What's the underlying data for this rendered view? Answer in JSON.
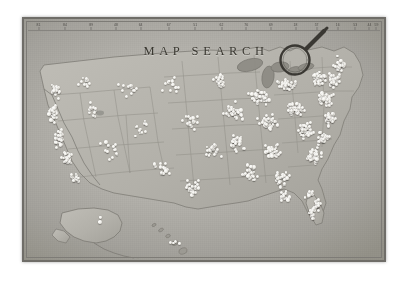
{
  "photo": {
    "alt_description": "Black and white photograph of a framed vintage United States wall map covered with white map pins",
    "background_color": "#ffffff"
  },
  "map": {
    "title": "MAP SEARCH",
    "frame_color": "#6f6d68",
    "paper_color": "#b5b3ad",
    "pin_color": "#f2f1ec",
    "land_color": "#b0aea7",
    "water_color": "#9b9992"
  },
  "magnifier": {
    "icon": "magnifying-glass-icon",
    "stroke_color": "#3a3833"
  },
  "ruler": {
    "label": "longitude-scale",
    "ticks": [
      {
        "value": "81",
        "x": 3
      },
      {
        "value": "84",
        "x": 10.5
      },
      {
        "value": "89",
        "x": 18
      },
      {
        "value": "48",
        "x": 25
      },
      {
        "value": "64",
        "x": 32
      },
      {
        "value": "67",
        "x": 40
      },
      {
        "value": "51",
        "x": 47.5
      },
      {
        "value": "62",
        "x": 55
      },
      {
        "value": "76",
        "x": 62
      },
      {
        "value": "69",
        "x": 69
      },
      {
        "value": "18",
        "x": 76
      },
      {
        "value": "57",
        "x": 82
      },
      {
        "value": "16",
        "x": 88
      },
      {
        "value": "53",
        "x": 93
      },
      {
        "value": "44",
        "x": 97
      },
      {
        "value": "59",
        "x": 99
      }
    ]
  },
  "regions": [
    {
      "name": "california-coast-cluster",
      "density": "high"
    },
    {
      "name": "pacific-northwest-cluster",
      "density": "medium"
    },
    {
      "name": "interior-west-sparse",
      "density": "low"
    },
    {
      "name": "texas-gulf-cluster",
      "density": "medium"
    },
    {
      "name": "midwest-cluster",
      "density": "medium"
    },
    {
      "name": "northeast-cluster",
      "density": "very-high"
    },
    {
      "name": "florida-coast-cluster",
      "density": "high"
    },
    {
      "name": "alaska-inset",
      "density": "low"
    },
    {
      "name": "hawaii-inset",
      "density": "low"
    }
  ]
}
